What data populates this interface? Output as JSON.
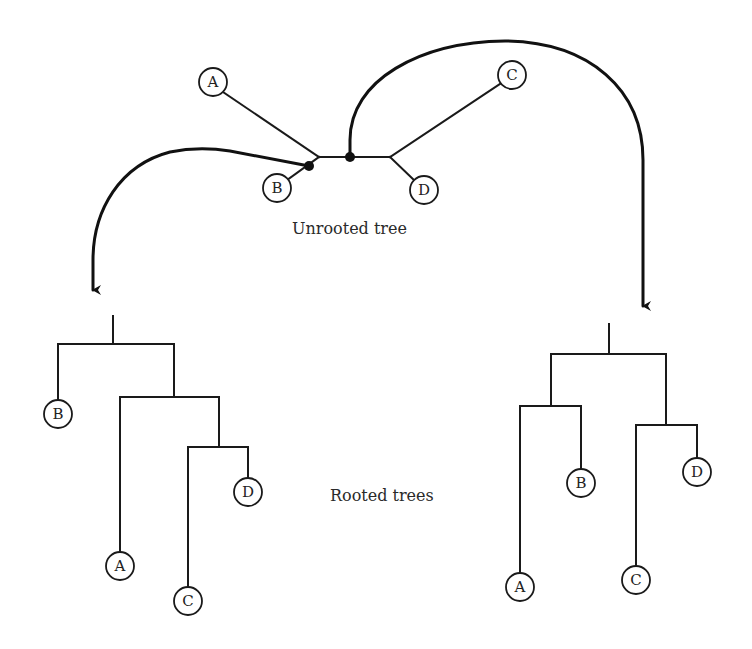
{
  "captions": {
    "unrooted": "Unrooted tree",
    "rooted": "Rooted trees"
  },
  "colors": {
    "line": "#1a1a1a",
    "background": "#ffffff",
    "text": "#222222"
  },
  "unrooted_tree": {
    "leaves": [
      {
        "id": "A",
        "label": "A"
      },
      {
        "id": "B",
        "label": "B"
      },
      {
        "id": "C",
        "label": "C"
      },
      {
        "id": "D",
        "label": "D"
      }
    ],
    "root_points": [
      {
        "id": "root-point-left",
        "description": "on branch leading to B"
      },
      {
        "id": "root-point-right",
        "description": "on internal branch"
      }
    ]
  },
  "rooted_tree_left": {
    "topology": "(B,(A,(C,D)))",
    "leaves": [
      {
        "id": "B",
        "label": "B"
      },
      {
        "id": "A",
        "label": "A"
      },
      {
        "id": "C",
        "label": "C"
      },
      {
        "id": "D",
        "label": "D"
      }
    ]
  },
  "rooted_tree_right": {
    "topology": "((A,B),(C,D))",
    "leaves": [
      {
        "id": "A",
        "label": "A"
      },
      {
        "id": "B",
        "label": "B"
      },
      {
        "id": "C",
        "label": "C"
      },
      {
        "id": "D",
        "label": "D"
      }
    ]
  }
}
